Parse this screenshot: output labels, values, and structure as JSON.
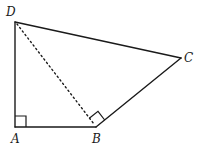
{
  "figure": {
    "type": "quadrilateral",
    "points": {
      "A": {
        "label": "A",
        "x": 15,
        "y": 127
      },
      "B": {
        "label": "B",
        "x": 96,
        "y": 127
      },
      "C": {
        "label": "C",
        "x": 181,
        "y": 58
      },
      "D": {
        "label": "D",
        "x": 15,
        "y": 22
      }
    },
    "edges": [
      {
        "from": "D",
        "to": "A",
        "style": "solid"
      },
      {
        "from": "A",
        "to": "B",
        "style": "solid"
      },
      {
        "from": "B",
        "to": "C",
        "style": "solid"
      },
      {
        "from": "C",
        "to": "D",
        "style": "solid"
      },
      {
        "from": "D",
        "to": "B",
        "style": "dotted"
      }
    ],
    "right_angles": [
      {
        "vertex": "A",
        "between": [
          "D",
          "B"
        ]
      },
      {
        "vertex": "B",
        "between": [
          "D",
          "C"
        ]
      }
    ]
  },
  "labels": {
    "A": "A",
    "B": "B",
    "C": "C",
    "D": "D"
  }
}
